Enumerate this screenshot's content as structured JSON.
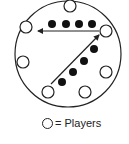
{
  "diagram": {
    "field": {
      "cx": 68,
      "cy": 54,
      "r": 53,
      "stroke": "#222222"
    },
    "players": [
      {
        "cx": 70,
        "cy": 6
      },
      {
        "cx": 26,
        "cy": 27
      },
      {
        "cx": 106,
        "cy": 31
      },
      {
        "cx": 23,
        "cy": 62
      },
      {
        "cx": 106,
        "cy": 72
      },
      {
        "cx": 48,
        "cy": 92
      },
      {
        "cx": 85,
        "cy": 92
      }
    ],
    "player_radius": 6,
    "balls_row": [
      {
        "cx": 52,
        "cy": 24
      },
      {
        "cx": 66,
        "cy": 24
      },
      {
        "cx": 79,
        "cy": 24
      },
      {
        "cx": 92,
        "cy": 24
      }
    ],
    "balls_diagonal": [
      {
        "cx": 94,
        "cy": 49
      },
      {
        "cx": 84,
        "cy": 61
      },
      {
        "cx": 73,
        "cy": 72
      },
      {
        "cx": 62,
        "cy": 82
      }
    ],
    "ball_radius": 4,
    "arrows": [
      {
        "from": [
          99,
          31
        ],
        "to": [
          38,
          31
        ]
      },
      {
        "from": [
          51,
          84
        ],
        "to": [
          99,
          35
        ]
      }
    ]
  },
  "legend": {
    "symbol": "open-circle",
    "label": "= Players"
  }
}
